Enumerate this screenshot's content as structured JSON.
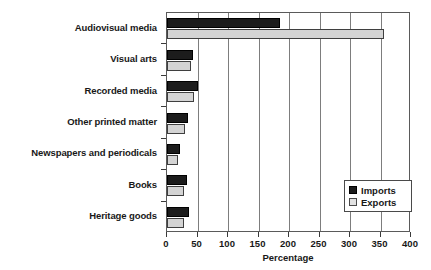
{
  "chart_data": {
    "type": "bar",
    "orientation": "horizontal",
    "title": "",
    "xlabel": "Percentage",
    "ylabel": "",
    "xlim": [
      0,
      400
    ],
    "xticks": [
      0,
      50,
      100,
      150,
      200,
      250,
      300,
      350,
      400
    ],
    "grid": true,
    "grid_axis": "x",
    "legend_position": "lower right",
    "categories": [
      "Audiovisual media",
      "Visual arts",
      "Recorded media",
      "Other printed matter",
      "Newspapers and periodicals",
      "Books",
      "Heritage goods"
    ],
    "series": [
      {
        "name": "Imports",
        "color": "#1c1c1c",
        "values": [
          185,
          43,
          50,
          34,
          21,
          33,
          36
        ]
      },
      {
        "name": "Exports",
        "color": "#d4d4d4",
        "values": [
          355,
          40,
          44,
          29,
          18,
          28,
          28
        ]
      }
    ]
  },
  "legend": {
    "items": [
      {
        "label": "Imports"
      },
      {
        "label": "Exports"
      }
    ]
  },
  "colors": {
    "imports": "#1c1c1c",
    "exports": "#d4d4d4",
    "axis": "#5a5a5a",
    "grid": "#7d7d7d",
    "text": "#181818"
  }
}
